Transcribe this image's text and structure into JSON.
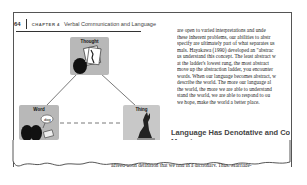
{
  "header": {
    "page_number": "64",
    "chapter_label": "CHAPTER 4",
    "chapter_title": "Verbal Communication and Language"
  },
  "figure": {
    "nodes": {
      "thought": "Thought",
      "word": "Word",
      "word_bubble": "dog",
      "thing": "Thing"
    },
    "caption_number": "FIGURE 4.2",
    "caption_title": "The Triangle of Meaning"
  },
  "right_column": {
    "lines": [
      "are open to varied interpretations and unde",
      "these inherent problems, our abilities to abstr",
      "specify are ultimately part of what separates us",
      "mals. Hayakawa (1990) developed an \"abstrac",
      "us understand this concept. The least abstract w",
      "at the ladder's lowest rung, the most abstract",
      "move up the abstraction ladder, you encounter",
      "words. When our language becomes abstract, w",
      "describe the world. The more our language al",
      "the world, the more we are able to understand",
      "stand the world, we are able to respond to ou",
      "we hope, make the world a better place."
    ]
  },
  "section": {
    "heading_line1": "Language Has Denotative and Con",
    "heading_line2": "Meaning",
    "lines": [
      "Understanding a word's two types of definitions—denotative and con",
      "you avoid using arbitrary language. A word's",
      "agreed-upon definition that we find in a dictionary. Thus, Marriage-"
    ],
    "bold_term": "denotative meaning"
  }
}
